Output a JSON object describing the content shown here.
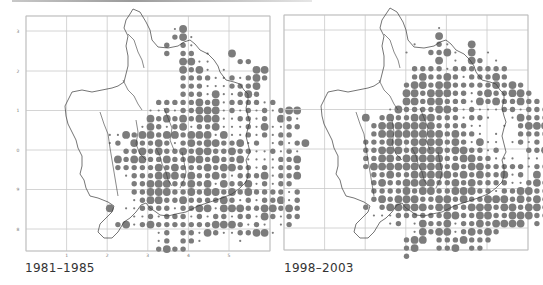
{
  "figure": {
    "panels": [
      {
        "id": "left",
        "caption": "1981–1985",
        "frame": {
          "x": 26,
          "y": 16,
          "w": 244,
          "h": 235
        },
        "grid_x": [
          26,
          66.6,
          107.2,
          147.8,
          188.4,
          229,
          270
        ],
        "grid_y": [
          16,
          31,
          71,
          110.5,
          150,
          189.5,
          229,
          251
        ],
        "x_ticks": [
          {
            "label": "1",
            "x": 66.6
          },
          {
            "label": "2",
            "x": 107.2
          },
          {
            "label": "3",
            "x": 147.8
          },
          {
            "label": "4",
            "x": 188.4
          },
          {
            "label": "5",
            "x": 229
          }
        ],
        "y_ticks": [
          {
            "label": "3",
            "y": 31
          },
          {
            "label": "2",
            "y": 71
          },
          {
            "label": "1",
            "y": 110.5
          },
          {
            "label": "0",
            "y": 150
          },
          {
            "label": "9",
            "y": 189.5
          },
          {
            "label": "8",
            "y": 229
          }
        ],
        "outline": "M133,9 L140,12 L146,22 L150,30 L152,40 L158,47 L168,48 L178,46 L184,42 L190,40 L195,44 L200,50 L208,54 L214,60 L218,66 L220,72 L226,80 L234,82 L240,84 L244,90 L248,94 L248,100 L246,108 L248,116 L250,122 L248,128 L246,136 L248,144 L250,152 L246,160 L248,168 L248,176 L246,182 L240,188 L232,194 L222,198 L210,202 L198,206 L186,212 L176,214 L168,216 L160,215 L156,212 L150,208 L146,203 L141,205 L136,212 L130,218 L124,222 L118,232 L112,238 L104,238 L98,232 L100,224 L106,218 L112,212 L114,206 L108,202 L98,198 L90,196 L86,188 L84,180 L80,174 L82,166 L82,156 L78,148 L76,140 L72,132 L68,124 L66,116 L65,106 L70,96 L72,92 L82,90 L92,92 L102,90 L112,88 L118,86 L124,82 L126,74 L128,66 L128,56 L126,46 L128,36 L124,28 L126,20 L130,14 Z",
        "inner_lines": [
          "M128,34 L134,40 L138,52 L142,60 L144,68",
          "M123,80 L128,90 L134,96 L138,104 L142,110",
          "M100,112 L104,124 L108,134 L110,148 L112,160 L114,172 L116,184 L118,196",
          "M136,120 L138,132 L136,144 L140,154 L146,160",
          "M164,108 L168,118 L172,128 L170,140 L174,150",
          "M156,148 L160,156 L162,164 L166,172 L168,180 L172,186",
          "M182,152 L184,162 L186,172 L184,180 L180,188"
        ],
        "dot_grid": {
          "origin_x": 69,
          "origin_y": 29,
          "step": 8.15,
          "rows": [
            ".............sL...........",
            ".............mLs..........",
            "............m.ms..........",
            "............m.mm.s..L.....",
            "..............LLss...mm...",
            "..............LmLs.s...LL.",
            "..............mmmmssmsmLm.",
            "..............mmmsssmmmL..",
            "..............mmmsLssmLm..",
            "...........mmmmmLmLsmmmmsm",
            "..........ssmsmmLLLsmsmsmsmLL.",
            "..........LmLmLmLLLssmmsm.Lms",
            ".........sLmsmLsmmLsssmsLssmm",
            ".....ssLmLLmLLmLLLsLssmsmsmm",
            ".....sm.LmmLmsmLmLLmmLsm.smsmL",
            ".......mmLmLmmLmLLmmLmmssmsms",
            "......LmLLmmLmmLLmLmmLssssmmL",
            "......mmmmmLmLmmmLmLLmmsmsmmm",
            ".......smmmLLLmLmmLmsmmmLsmmL",
            "........mmLLLmmLmLsLmmLsmsmm",
            "........mmLLLmmLmLLmLmLmmmmsm",
            "........smLLmmLmmmmLmsmsmmLsm",
            ".....L.ssmmmmsmmLLsLLLmmLLmLm",
            "........ssmsmmmsmsmmsmmsLmsmm",
            "......mLsmLmmmmmmmLLLmsms.sm",
            "...........sm.mmsLmssmmLLs.",
            "...........sm.mms....s..",
            "...........mLmm.........",
            "..........................."
          ]
        }
      },
      {
        "id": "right",
        "caption": "1998–2003",
        "frame": {
          "x": 284,
          "y": 15,
          "w": 244,
          "h": 235
        },
        "grid_x": [
          284,
          324.6,
          365.2,
          405.8,
          446.4,
          487,
          528
        ],
        "grid_y": [
          15,
          30,
          70,
          109.5,
          149,
          188.5,
          228,
          250
        ],
        "x_ticks": [],
        "y_ticks": [],
        "outline": "M390,8 L397,12 L403,22 L406,30 L408,40 L414,47 L424,48 L434,46 L440,42 L446,40 L451,44 L456,50 L464,54 L470,60 L474,66 L476,72 L482,80 L490,82 L496,84 L500,90 L504,94 L504,100 L502,108 L504,116 L506,122 L504,128 L502,136 L504,144 L506,152 L502,160 L504,168 L504,176 L502,182 L496,188 L488,194 L478,198 L466,202 L454,206 L442,212 L432,214 L424,216 L416,215 L412,212 L406,208 L402,203 L397,205 L392,212 L386,218 L380,222 L374,232 L368,238 L360,238 L354,232 L356,224 L362,218 L368,212 L370,206 L364,202 L354,198 L346,196 L342,188 L340,180 L336,174 L338,166 L338,156 L334,148 L332,140 L328,132 L324,124 L322,116 L321,106 L326,96 L328,92 L338,90 L348,92 L358,90 L368,88 L374,86 L380,82 L382,74 L384,66 L384,56 L382,46 L384,36 L380,28 L382,20 L386,14 Z",
        "inner_lines": [
          "M384,34 L390,40 L394,52 L398,60 L400,68",
          "M379,80 L384,90 L390,96 L394,104 L398,110",
          "M356,112 L360,124 L364,134 L366,148 L368,160 L370,172 L372,184 L374,196",
          "M392,120 L394,132 L392,144 L396,154 L402,160",
          "M420,108 L424,118 L428,128 L426,140 L430,150",
          "M412,148 L416,156 L418,164 L422,172 L424,180 L428,186",
          "M438,152 L440,162 L442,172 L440,180 L436,188"
        ],
        "dot_grid": {
          "origin_x": 325,
          "origin_y": 28,
          "step": 8.15,
          "rows": [
            "..............s............",
            "..............L............",
            "...........s..ms..L........",
            "..........s..mmLs.L.s......",
            "..............L.s.Lm.s.....",
            "...........mmmmsmmmmmmm....",
            "...........mLmmLmsmmmLm....",
            "..........mLLmLLmmmmmLmLm..",
            "..........LLmLLLmmsmLmmLLm.",
            "..........LLmLLmmmsLmLmmLmm",
            "........sLmmmmLLmsmsssmmsmmmL",
            ".....L.mLmmLLLmmmsmms..sLmmmL",
            "......mLLLLLLLmmmmss..s.mLLLs",
            "......mLLLLLLLLmLmms.s..mmmmm",
            ".....mmmLLmLLLLmLmsLss.smsmsmL",
            ".....mmLLLmLLLLmLLmmsm...mmLLL",
            ".....mmLLmLLLLLmmLLmmsss.ss.Lm",
            ".....mLLLLLLLLLmLmLLmmmmmsmmLm",
            "......mmLmmLLLLLmLmLmmLsm.Lsm",
            "......mLmmLLLLmmLmLmmmmssmLmm",
            "......mmmmLmLLmmLLLmmsmmLLmm",
            "......mLmLLLmmLLmLmmLLLmLmLmL",
            ".....m.mLLLLLmLLmmLLLmLLmLLm",
            "......sssmmmmmmLLmmLLmmLLLmm",
            "........sm.sLmmLsmmLmLLLL.m",
            "...........sLmLLsmLmLm.",
            "..........mLL.mmmLmmm.",
            "..........mL..mmL.mm..",
            "..........m................"
          ]
        }
      }
    ],
    "colors": {
      "dot": "#7c7c7c",
      "grid": "#c9c9c9",
      "outline": "#3a3a3a",
      "frame": "#bdbdbd",
      "caption": "#333333"
    },
    "dot_sizes": {
      "s": 1.1,
      "m": 2.7,
      "L": 3.9
    }
  }
}
